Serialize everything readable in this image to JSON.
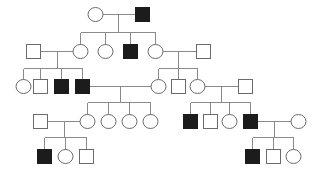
{
  "diagram": {
    "type": "pedigree",
    "title": "",
    "legend": {
      "square": "male",
      "circle": "female",
      "filled": "affected",
      "open": "unaffected"
    },
    "colors": {
      "affected_fill": "#1c1c1c",
      "outline": "#6a6a6a",
      "line": "#8a8a8a",
      "background": "#ffffff"
    },
    "individuals": [
      {
        "id": "I-1",
        "sex": "female",
        "affected": false,
        "x": 95,
        "y": 14
      },
      {
        "id": "I-2",
        "sex": "male",
        "affected": true,
        "x": 142,
        "y": 14
      },
      {
        "id": "II-1",
        "sex": "male",
        "affected": false,
        "x": 33,
        "y": 51
      },
      {
        "id": "II-2",
        "sex": "female",
        "affected": false,
        "x": 80,
        "y": 51
      },
      {
        "id": "II-3",
        "sex": "female",
        "affected": false,
        "x": 105,
        "y": 51
      },
      {
        "id": "II-4",
        "sex": "male",
        "affected": true,
        "x": 130,
        "y": 51
      },
      {
        "id": "II-5",
        "sex": "female",
        "affected": false,
        "x": 155,
        "y": 51
      },
      {
        "id": "II-6",
        "sex": "male",
        "affected": false,
        "x": 203,
        "y": 51
      },
      {
        "id": "III-1",
        "sex": "female",
        "affected": false,
        "x": 23,
        "y": 86
      },
      {
        "id": "III-2",
        "sex": "male",
        "affected": false,
        "x": 40,
        "y": 86
      },
      {
        "id": "III-3",
        "sex": "male",
        "affected": true,
        "x": 61,
        "y": 86
      },
      {
        "id": "III-4",
        "sex": "male",
        "affected": true,
        "x": 82,
        "y": 86
      },
      {
        "id": "III-5",
        "sex": "female",
        "affected": false,
        "x": 158,
        "y": 86
      },
      {
        "id": "III-6",
        "sex": "male",
        "affected": false,
        "x": 178,
        "y": 86
      },
      {
        "id": "III-7",
        "sex": "female",
        "affected": false,
        "x": 197,
        "y": 86
      },
      {
        "id": "III-8",
        "sex": "male",
        "affected": false,
        "x": 245,
        "y": 86
      },
      {
        "id": "IV-1",
        "sex": "male",
        "affected": false,
        "x": 40,
        "y": 121
      },
      {
        "id": "IV-2",
        "sex": "female",
        "affected": false,
        "x": 87,
        "y": 121
      },
      {
        "id": "IV-3",
        "sex": "female",
        "affected": false,
        "x": 108,
        "y": 121
      },
      {
        "id": "IV-4",
        "sex": "female",
        "affected": false,
        "x": 129,
        "y": 121
      },
      {
        "id": "IV-5",
        "sex": "female",
        "affected": false,
        "x": 150,
        "y": 121
      },
      {
        "id": "IV-6",
        "sex": "male",
        "affected": true,
        "x": 190,
        "y": 121
      },
      {
        "id": "IV-7",
        "sex": "male",
        "affected": false,
        "x": 210,
        "y": 121
      },
      {
        "id": "IV-8",
        "sex": "female",
        "affected": false,
        "x": 229,
        "y": 121
      },
      {
        "id": "IV-9",
        "sex": "male",
        "affected": true,
        "x": 250,
        "y": 121
      },
      {
        "id": "IV-10",
        "sex": "female",
        "affected": false,
        "x": 298,
        "y": 121
      },
      {
        "id": "V-1",
        "sex": "male",
        "affected": true,
        "x": 44,
        "y": 156
      },
      {
        "id": "V-2",
        "sex": "female",
        "affected": false,
        "x": 65,
        "y": 156
      },
      {
        "id": "V-3",
        "sex": "male",
        "affected": false,
        "x": 86,
        "y": 156
      },
      {
        "id": "V-4",
        "sex": "male",
        "affected": true,
        "x": 252,
        "y": 156
      },
      {
        "id": "V-5",
        "sex": "male",
        "affected": false,
        "x": 273,
        "y": 156
      },
      {
        "id": "V-6",
        "sex": "female",
        "affected": false,
        "x": 293,
        "y": 156
      }
    ],
    "families": [
      {
        "parents": [
          "I-1",
          "I-2"
        ],
        "descent_x": 118,
        "sibship_y": 32,
        "children": [
          "II-2",
          "II-3",
          "II-4",
          "II-5"
        ]
      },
      {
        "parents": [
          "II-1",
          "II-2"
        ],
        "descent_x": 57,
        "sibship_y": 68,
        "children": [
          "III-1",
          "III-2",
          "III-3",
          "III-4"
        ]
      },
      {
        "parents": [
          "II-5",
          "II-6"
        ],
        "descent_x": 178,
        "sibship_y": 68,
        "children": [
          "III-5",
          "III-6",
          "III-7"
        ]
      },
      {
        "parents": [
          "III-4",
          "III-5"
        ],
        "descent_x": 120,
        "sibship_y": 102,
        "children": [
          "IV-2",
          "IV-3",
          "IV-4",
          "IV-5"
        ]
      },
      {
        "parents": [
          "III-7",
          "III-8"
        ],
        "descent_x": 221,
        "sibship_y": 102,
        "children": [
          "IV-6",
          "IV-7",
          "IV-8",
          "IV-9"
        ]
      },
      {
        "parents": [
          "IV-1",
          "IV-2"
        ],
        "descent_x": 64,
        "sibship_y": 137,
        "children": [
          "V-1",
          "V-2",
          "V-3"
        ]
      },
      {
        "parents": [
          "IV-9",
          "IV-10"
        ],
        "descent_x": 274,
        "sibship_y": 137,
        "children": [
          "V-4",
          "V-5",
          "V-6"
        ]
      }
    ],
    "symbol_size": 14
  }
}
